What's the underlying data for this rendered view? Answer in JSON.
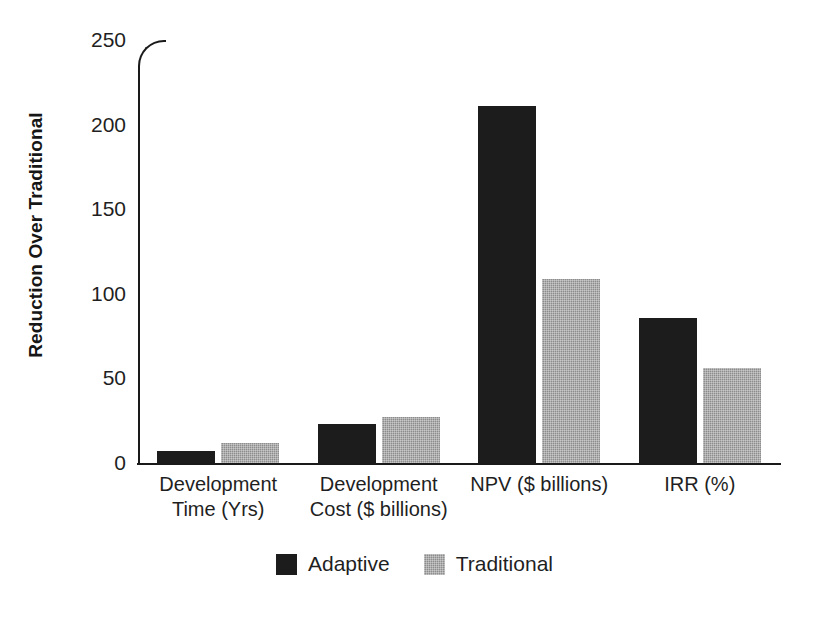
{
  "chart_data": {
    "type": "bar",
    "title": "",
    "subtitle": "",
    "xlabel": "",
    "ylabel": "Reduction Over Traditional",
    "ylim": [
      0,
      250
    ],
    "yticks": [
      0,
      50,
      100,
      150,
      200,
      250
    ],
    "ytick_labels": [
      "0",
      "50",
      "100",
      "150",
      "200",
      "250"
    ],
    "grid": false,
    "legend_position": "bottom-center",
    "orientation": "vertical",
    "grouping": "grouped",
    "categories": [
      "Development Time (Yrs)",
      "Development Cost ($ billions)",
      "NPV ($ billions)",
      "IRR (%)"
    ],
    "category_lines": [
      [
        "Development",
        "Time (Yrs)"
      ],
      [
        "Development",
        "Cost ($ billions)"
      ],
      [
        "NPV ($ billions)"
      ],
      [
        "IRR (%)"
      ]
    ],
    "series": [
      {
        "name": "Adaptive",
        "color": "#1c1c1c",
        "values": [
          7,
          23,
          211,
          86
        ]
      },
      {
        "name": "Traditional",
        "color": "#8d8d8d",
        "values": [
          12,
          27,
          109,
          56
        ]
      }
    ]
  },
  "legend": {
    "entries": [
      {
        "label": "Adaptive",
        "color": "#1c1c1c"
      },
      {
        "label": "Traditional",
        "color": "#8d8d8d"
      }
    ]
  },
  "colors": {
    "adaptive": "#1c1c1c",
    "traditional": "#8d8d8d",
    "axis": "#1a1a1a",
    "text": "#1f1f1f",
    "background": "#ffffff"
  }
}
